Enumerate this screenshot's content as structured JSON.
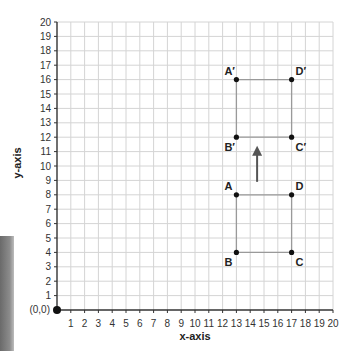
{
  "chart_data": {
    "type": "scatter",
    "title": "",
    "xlabel": "x-axis",
    "ylabel": "y-axis",
    "xlim": [
      0,
      20
    ],
    "ylim": [
      0,
      20
    ],
    "grid": true,
    "origin_label": "(0,0)",
    "x_ticks": [
      "1",
      "2",
      "3",
      "4",
      "5",
      "6",
      "7",
      "8",
      "9",
      "10",
      "11",
      "12",
      "13",
      "14",
      "15",
      "16",
      "17",
      "18",
      "19",
      "20"
    ],
    "y_ticks": [
      "1",
      "2",
      "3",
      "4",
      "5",
      "6",
      "7",
      "8",
      "9",
      "10",
      "11",
      "12",
      "13",
      "14",
      "15",
      "16",
      "17",
      "18",
      "19",
      "20"
    ],
    "shapes": [
      {
        "name": "original",
        "points": [
          {
            "label": "A",
            "x": 13,
            "y": 8
          },
          {
            "label": "D",
            "x": 17,
            "y": 8
          },
          {
            "label": "C",
            "x": 17,
            "y": 4
          },
          {
            "label": "B",
            "x": 13,
            "y": 4
          }
        ]
      },
      {
        "name": "image",
        "points": [
          {
            "label": "A′",
            "x": 13,
            "y": 16
          },
          {
            "label": "D′",
            "x": 17,
            "y": 16
          },
          {
            "label": "C′",
            "x": 17,
            "y": 12
          },
          {
            "label": "B′",
            "x": 13,
            "y": 12
          }
        ]
      }
    ],
    "annotations": [
      {
        "type": "arrow",
        "from": [
          14.5,
          8.9
        ],
        "to": [
          14.5,
          11.4
        ],
        "meaning": "translation upward by 8"
      }
    ]
  },
  "colors": {
    "grid": "#d4d4d4",
    "axis": "#333333",
    "shape_edge": "#9a9a9a",
    "point": "#111111",
    "arrow": "#555555"
  }
}
